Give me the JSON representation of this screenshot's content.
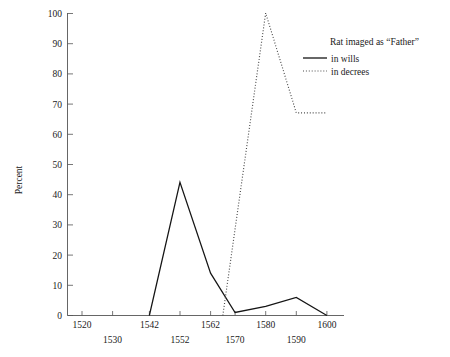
{
  "chart_data": {
    "type": "line",
    "title": "",
    "xlabel": "",
    "ylabel": "Percent",
    "xlim": [
      1515,
      1605
    ],
    "ylim": [
      0,
      100
    ],
    "grid": false,
    "legend_position": "top-right",
    "legend_title": "Rat imaged as “Father”",
    "xticks": [
      1520,
      1530,
      1542,
      1552,
      1562,
      1570,
      1580,
      1590,
      1600
    ],
    "xtick_labels_row1": [
      "1520",
      "1542",
      "1562",
      "1580",
      "1600"
    ],
    "xtick_labels_row2": [
      "1530",
      "1552",
      "1570",
      "1590"
    ],
    "yticks": [
      0,
      10,
      20,
      30,
      40,
      50,
      60,
      70,
      80,
      90,
      100
    ],
    "ytick_labels": [
      "0",
      "10",
      "20",
      "30",
      "40",
      "50",
      "60",
      "70",
      "80",
      "90",
      "100"
    ],
    "series": [
      {
        "name": "in wills",
        "style": "solid",
        "color": "#151515",
        "x": [
          1542,
          1552,
          1562,
          1570,
          1580,
          1590,
          1600
        ],
        "values": [
          0,
          44,
          14,
          1,
          3,
          6,
          0
        ]
      },
      {
        "name": "in decrees",
        "style": "dotted",
        "color": "#4a4a4a",
        "x": [
          1566,
          1580,
          1590,
          1600
        ],
        "values": [
          0,
          100,
          67,
          67
        ]
      }
    ]
  },
  "legend": {
    "title": "Rat imaged as “Father”",
    "entries": [
      {
        "label": "in wills",
        "style": "solid"
      },
      {
        "label": "in decrees",
        "style": "dotted"
      }
    ]
  },
  "axes": {
    "y_title": "Percent",
    "y_tick_labels": [
      "100",
      "90",
      "80",
      "70",
      "60",
      "50",
      "40",
      "30",
      "20",
      "10",
      "0"
    ],
    "x_tick_labels_upper": [
      "1520",
      "1542",
      "1562",
      "1580",
      "1600"
    ],
    "x_tick_labels_lower": [
      "1530",
      "1552",
      "1570",
      "1590"
    ]
  }
}
